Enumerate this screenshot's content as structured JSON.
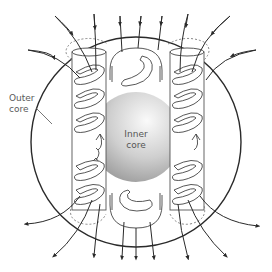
{
  "labels": {
    "outer_core_line1": "Outer",
    "outer_core_line2": "core",
    "inner_core_line1": "Inner",
    "inner_core_line2": "core"
  },
  "elements": {
    "outer_boundary": "outer-core-boundary-circle",
    "inner_core": "inner-core-sphere",
    "convection_columns": [
      "left-column",
      "middle-column",
      "right-column"
    ],
    "field_lines": "magnetic-field-lines",
    "field_line_direction": "entering top, exiting bottom"
  },
  "colors": {
    "line": "#2a2a2a",
    "inner_core_light": "#f2f2f2",
    "inner_core_dark": "#9a9a9a",
    "background": "#ffffff"
  }
}
